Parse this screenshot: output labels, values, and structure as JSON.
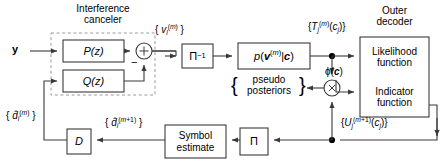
{
  "diagram": {
    "title_interference": "Interference\ncanceler",
    "title_outer": "Outer\ndecoder",
    "blocks": {
      "p_z": "P(z)",
      "q_z": "Q(z)",
      "pi_inv": "Π⁻¹",
      "pvc": "p(v(m)|c)",
      "likelihood": "Likelihood\nfunction",
      "indicator": "Indicator\nfunction",
      "symbol_estimate": "Symbol\nestimate",
      "pi": "Π",
      "delay": "D",
      "sum": "+",
      "product": "×"
    },
    "signals": {
      "input_y": "y",
      "v_label": "{ vl(m) }",
      "t_label": "{Tj(m)(cj)}",
      "u_label": "{Uj(m+1)(cj)}",
      "phi_label": "ϕ(c)",
      "d_hat_m": "{ dl(m) }",
      "d_hat_m1": "{ dl(m+1) }",
      "pseudo_posteriors": "pseudo\nposteriors",
      "minus_sign": "−"
    },
    "colors": {
      "line": "#3a3a3a",
      "dashed": "#9a9a9a",
      "text": "#000000",
      "background": "#ffffff"
    }
  }
}
